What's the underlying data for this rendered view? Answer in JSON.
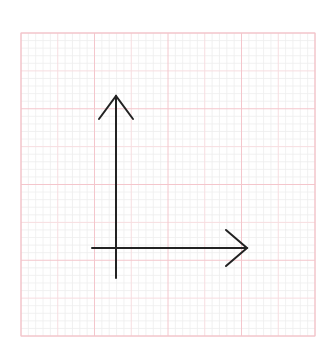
{
  "diagram": {
    "type": "coordinate-axes-on-grid-paper",
    "background_color": "#ffffff",
    "grid": {
      "x": 21,
      "y": 33,
      "width": 294,
      "height": 303,
      "major_divisions_x": 4,
      "major_divisions_y": 4,
      "sub_divisions": 2,
      "minor_per_sub": 5,
      "major_color": "#f4c6cc",
      "sub_color": "#f7dde0",
      "minor_color": "#eeeeee",
      "border_color": "#f2c4ca"
    },
    "axes": {
      "color": "#222222",
      "stroke_width": 2,
      "origin": {
        "x": 116,
        "y": 248
      },
      "y_axis": {
        "tip": {
          "x": 116,
          "y": 96
        },
        "tail": {
          "x": 116,
          "y": 278
        },
        "head_left": {
          "x": 99,
          "y": 119
        },
        "head_right": {
          "x": 133,
          "y": 119
        },
        "direction": "up"
      },
      "x_axis": {
        "tip": {
          "x": 247,
          "y": 248
        },
        "tail": {
          "x": 92,
          "y": 248
        },
        "head_top": {
          "x": 226,
          "y": 230
        },
        "head_bottom": {
          "x": 226,
          "y": 266
        },
        "direction": "right"
      }
    }
  }
}
